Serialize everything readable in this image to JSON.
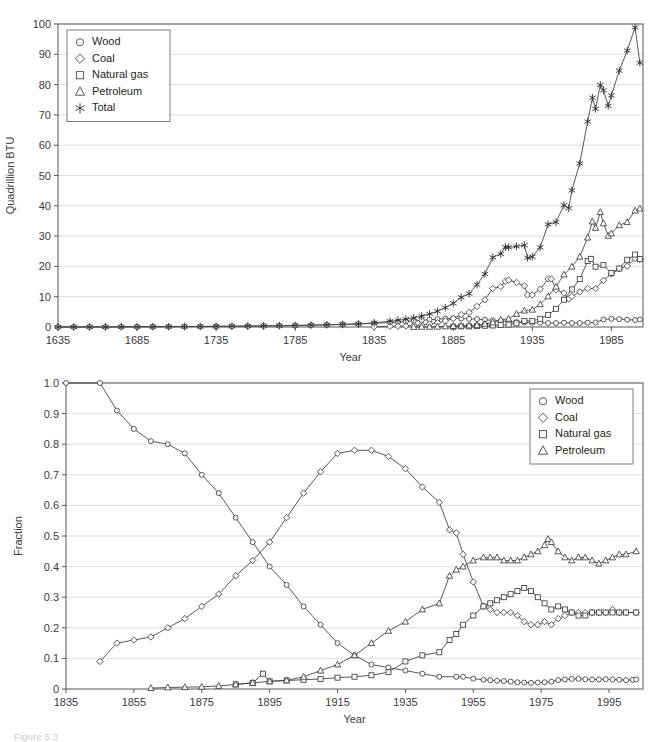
{
  "figure": {
    "caption_fragment": "Figure 5.3"
  },
  "chart_data": [
    {
      "id": "top",
      "type": "line",
      "title": "",
      "xlabel": "Year",
      "ylabel": "Quadrillion BTU",
      "xlim": [
        1635,
        2005
      ],
      "ylim": [
        0,
        100
      ],
      "xticks": [
        1635,
        1685,
        1735,
        1785,
        1835,
        1885,
        1935,
        1985
      ],
      "yticks": [
        0,
        10,
        20,
        30,
        40,
        50,
        60,
        70,
        80,
        90,
        100
      ],
      "grid": "horizontal",
      "legend_position": "top-left",
      "legend": [
        "Wood",
        "Coal",
        "Natural gas",
        "Petroleum",
        "Total"
      ],
      "markers": {
        "Wood": "circle",
        "Coal": "diamond",
        "Natural gas": "square",
        "Petroleum": "triangle",
        "Total": "star"
      },
      "series": [
        {
          "name": "Wood",
          "marker": "circle",
          "x": [
            1635,
            1645,
            1655,
            1665,
            1675,
            1685,
            1695,
            1705,
            1715,
            1725,
            1735,
            1745,
            1755,
            1765,
            1775,
            1785,
            1795,
            1805,
            1815,
            1825,
            1835,
            1845,
            1850,
            1855,
            1860,
            1865,
            1870,
            1875,
            1880,
            1885,
            1890,
            1895,
            1900,
            1905,
            1910,
            1915,
            1920,
            1925,
            1930,
            1935,
            1940,
            1945,
            1950,
            1955,
            1960,
            1965,
            1970,
            1975,
            1980,
            1985,
            1990,
            1995,
            2000,
            2003
          ],
          "y": [
            0.01,
            0.02,
            0.03,
            0.04,
            0.05,
            0.07,
            0.09,
            0.11,
            0.14,
            0.17,
            0.2,
            0.25,
            0.3,
            0.36,
            0.43,
            0.5,
            0.6,
            0.72,
            0.85,
            1.0,
            1.2,
            1.5,
            1.6,
            1.8,
            2.0,
            2.2,
            2.4,
            2.6,
            2.8,
            2.9,
            2.8,
            2.7,
            2.6,
            2.4,
            2.2,
            2.0,
            1.8,
            1.6,
            1.5,
            1.4,
            1.4,
            1.3,
            1.3,
            1.4,
            1.3,
            1.3,
            1.4,
            1.5,
            2.5,
            2.7,
            2.6,
            2.4,
            2.3,
            2.5
          ]
        },
        {
          "name": "Coal",
          "marker": "diamond",
          "x": [
            1835,
            1845,
            1850,
            1855,
            1860,
            1865,
            1870,
            1875,
            1880,
            1885,
            1890,
            1895,
            1900,
            1905,
            1910,
            1915,
            1918,
            1920,
            1925,
            1930,
            1932,
            1935,
            1940,
            1945,
            1947,
            1950,
            1955,
            1958,
            1960,
            1965,
            1970,
            1975,
            1980,
            1985,
            1990,
            1995,
            2000,
            2003
          ],
          "y": [
            0.1,
            0.2,
            0.25,
            0.3,
            0.5,
            0.7,
            1.0,
            1.4,
            2.0,
            2.8,
            4.1,
            4.8,
            6.8,
            9.0,
            12.7,
            13.3,
            15.1,
            15.5,
            14.7,
            13.6,
            10.6,
            10.6,
            12.5,
            15.9,
            15.9,
            12.3,
            11.2,
            9.3,
            10.1,
            11.6,
            12.7,
            12.7,
            15.4,
            17.5,
            19.2,
            20.1,
            22.6,
            22.3
          ]
        },
        {
          "name": "Natural gas",
          "marker": "square",
          "x": [
            1885,
            1890,
            1895,
            1900,
            1905,
            1910,
            1915,
            1920,
            1925,
            1930,
            1935,
            1940,
            1945,
            1950,
            1955,
            1960,
            1965,
            1970,
            1972,
            1975,
            1980,
            1985,
            1990,
            1995,
            2000,
            2003
          ],
          "y": [
            0.1,
            0.2,
            0.2,
            0.3,
            0.4,
            0.5,
            0.7,
            0.8,
            1.2,
            2.0,
            2.0,
            2.7,
            4.0,
            6.0,
            9.0,
            12.4,
            15.8,
            21.8,
            22.5,
            19.9,
            20.4,
            17.8,
            19.3,
            22.2,
            23.9,
            22.4
          ]
        },
        {
          "name": "Petroleum",
          "marker": "triangle",
          "x": [
            1860,
            1865,
            1870,
            1875,
            1880,
            1885,
            1890,
            1895,
            1900,
            1905,
            1910,
            1915,
            1920,
            1925,
            1930,
            1935,
            1940,
            1945,
            1950,
            1955,
            1960,
            1965,
            1970,
            1973,
            1975,
            1978,
            1980,
            1983,
            1985,
            1990,
            1995,
            2000,
            2003
          ],
          "y": [
            0.01,
            0.03,
            0.05,
            0.1,
            0.2,
            0.3,
            0.4,
            0.5,
            0.6,
            1.0,
            1.5,
            2.4,
            2.7,
            4.3,
            5.4,
            5.7,
            7.5,
            10.1,
            13.3,
            17.3,
            19.9,
            23.2,
            29.5,
            34.8,
            32.7,
            37.9,
            34.2,
            30.1,
            30.9,
            33.6,
            34.6,
            38.4,
            39.1
          ]
        },
        {
          "name": "Total",
          "marker": "star",
          "x": [
            1635,
            1645,
            1655,
            1665,
            1675,
            1685,
            1695,
            1705,
            1715,
            1725,
            1735,
            1745,
            1755,
            1765,
            1775,
            1785,
            1795,
            1805,
            1815,
            1825,
            1835,
            1845,
            1850,
            1855,
            1860,
            1865,
            1870,
            1875,
            1880,
            1885,
            1890,
            1895,
            1900,
            1905,
            1910,
            1915,
            1918,
            1920,
            1925,
            1930,
            1932,
            1935,
            1940,
            1945,
            1950,
            1955,
            1958,
            1960,
            1965,
            1970,
            1973,
            1975,
            1978,
            1980,
            1983,
            1985,
            1990,
            1995,
            2000,
            2003
          ],
          "y": [
            0.01,
            0.02,
            0.03,
            0.04,
            0.05,
            0.07,
            0.09,
            0.11,
            0.14,
            0.17,
            0.2,
            0.25,
            0.3,
            0.36,
            0.43,
            0.5,
            0.6,
            0.72,
            0.85,
            1.0,
            1.4,
            1.9,
            2.2,
            2.6,
            3.0,
            3.6,
            4.3,
            5.2,
            6.4,
            7.8,
            9.8,
            11.0,
            14.0,
            17.5,
            23.0,
            24.1,
            26.4,
            26.3,
            26.6,
            27.0,
            22.8,
            23.2,
            26.3,
            33.9,
            34.6,
            40.2,
            39.2,
            45.1,
            54.0,
            67.8,
            75.7,
            72.0,
            79.9,
            78.1,
            73.0,
            76.4,
            84.6,
            91.2,
            98.9,
            87.2
          ]
        }
      ]
    },
    {
      "id": "bottom",
      "type": "line",
      "title": "",
      "xlabel": "Year",
      "ylabel": "Fraction",
      "xlim": [
        1835,
        2005
      ],
      "ylim": [
        0,
        1.0
      ],
      "xticks": [
        1835,
        1855,
        1875,
        1895,
        1915,
        1935,
        1955,
        1975,
        1995
      ],
      "yticks": [
        0,
        0.1,
        0.2,
        0.3,
        0.4,
        0.5,
        0.6,
        0.7,
        0.8,
        0.9,
        1.0
      ],
      "ytick_labels": [
        "0",
        "0.1",
        "0.2",
        "0.3",
        "0.4",
        "0.5",
        "0.6",
        "0.7",
        "0.8",
        "0.9",
        "1.0"
      ],
      "grid": "horizontal",
      "legend_position": "top-right",
      "legend": [
        "Wood",
        "Coal",
        "Natural gas",
        "Petroleum"
      ],
      "markers": {
        "Wood": "circle",
        "Coal": "diamond",
        "Natural gas": "square",
        "Petroleum": "triangle"
      },
      "series": [
        {
          "name": "Wood",
          "marker": "circle",
          "x": [
            1835,
            1845,
            1850,
            1855,
            1860,
            1865,
            1870,
            1875,
            1880,
            1885,
            1890,
            1895,
            1900,
            1905,
            1910,
            1915,
            1920,
            1925,
            1930,
            1935,
            1940,
            1945,
            1950,
            1952,
            1955,
            1958,
            1960,
            1962,
            1964,
            1966,
            1968,
            1970,
            1972,
            1974,
            1976,
            1978,
            1980,
            1982,
            1984,
            1986,
            1988,
            1990,
            1992,
            1994,
            1996,
            1998,
            2000,
            2002,
            2003
          ],
          "y": [
            1.0,
            1.0,
            0.91,
            0.85,
            0.81,
            0.8,
            0.77,
            0.7,
            0.64,
            0.56,
            0.48,
            0.4,
            0.34,
            0.27,
            0.21,
            0.15,
            0.11,
            0.08,
            0.07,
            0.06,
            0.05,
            0.04,
            0.04,
            0.04,
            0.034,
            0.03,
            0.029,
            0.027,
            0.026,
            0.024,
            0.022,
            0.021,
            0.02,
            0.021,
            0.022,
            0.024,
            0.029,
            0.031,
            0.033,
            0.033,
            0.032,
            0.031,
            0.031,
            0.032,
            0.031,
            0.03,
            0.029,
            0.03,
            0.031
          ]
        },
        {
          "name": "Coal",
          "marker": "diamond",
          "x": [
            1845,
            1850,
            1855,
            1860,
            1865,
            1870,
            1875,
            1880,
            1885,
            1890,
            1895,
            1900,
            1905,
            1910,
            1915,
            1920,
            1925,
            1930,
            1935,
            1940,
            1945,
            1948,
            1950,
            1952,
            1955,
            1958,
            1960,
            1962,
            1964,
            1966,
            1968,
            1970,
            1972,
            1974,
            1976,
            1978,
            1980,
            1982,
            1984,
            1986,
            1988,
            1990,
            1992,
            1994,
            1996,
            1998,
            2000,
            2003
          ],
          "y": [
            0.09,
            0.15,
            0.16,
            0.17,
            0.2,
            0.23,
            0.27,
            0.31,
            0.37,
            0.42,
            0.48,
            0.56,
            0.64,
            0.71,
            0.77,
            0.78,
            0.78,
            0.76,
            0.72,
            0.66,
            0.61,
            0.52,
            0.51,
            0.44,
            0.35,
            0.27,
            0.26,
            0.25,
            0.25,
            0.25,
            0.24,
            0.22,
            0.21,
            0.21,
            0.22,
            0.21,
            0.23,
            0.24,
            0.25,
            0.25,
            0.25,
            0.25,
            0.25,
            0.25,
            0.26,
            0.25,
            0.25,
            0.25
          ]
        },
        {
          "name": "Natural gas",
          "marker": "square",
          "x": [
            1885,
            1890,
            1893,
            1895,
            1900,
            1905,
            1910,
            1915,
            1920,
            1925,
            1930,
            1935,
            1940,
            1945,
            1948,
            1950,
            1952,
            1955,
            1958,
            1960,
            1962,
            1964,
            1966,
            1968,
            1970,
            1972,
            1974,
            1976,
            1978,
            1980,
            1982,
            1984,
            1986,
            1988,
            1990,
            1992,
            1994,
            1996,
            1998,
            2000,
            2003
          ],
          "y": [
            0.015,
            0.02,
            0.05,
            0.025,
            0.028,
            0.03,
            0.033,
            0.037,
            0.04,
            0.045,
            0.055,
            0.09,
            0.11,
            0.12,
            0.16,
            0.18,
            0.21,
            0.24,
            0.27,
            0.28,
            0.29,
            0.3,
            0.31,
            0.32,
            0.33,
            0.32,
            0.3,
            0.28,
            0.26,
            0.27,
            0.26,
            0.25,
            0.24,
            0.24,
            0.25,
            0.25,
            0.25,
            0.25,
            0.25,
            0.25,
            0.25
          ]
        },
        {
          "name": "Petroleum",
          "marker": "triangle",
          "x": [
            1860,
            1865,
            1870,
            1875,
            1880,
            1885,
            1890,
            1895,
            1900,
            1905,
            1910,
            1915,
            1920,
            1925,
            1930,
            1935,
            1940,
            1945,
            1948,
            1950,
            1952,
            1955,
            1958,
            1960,
            1962,
            1964,
            1966,
            1968,
            1970,
            1972,
            1974,
            1976,
            1977,
            1978,
            1980,
            1982,
            1984,
            1986,
            1988,
            1990,
            1992,
            1994,
            1996,
            1998,
            2000,
            2003
          ],
          "y": [
            0.003,
            0.005,
            0.006,
            0.007,
            0.01,
            0.015,
            0.02,
            0.025,
            0.028,
            0.04,
            0.06,
            0.08,
            0.11,
            0.15,
            0.19,
            0.22,
            0.26,
            0.28,
            0.37,
            0.39,
            0.4,
            0.42,
            0.43,
            0.43,
            0.43,
            0.42,
            0.42,
            0.42,
            0.43,
            0.44,
            0.45,
            0.47,
            0.49,
            0.48,
            0.45,
            0.43,
            0.42,
            0.43,
            0.43,
            0.42,
            0.41,
            0.42,
            0.43,
            0.44,
            0.44,
            0.45
          ]
        }
      ]
    }
  ]
}
